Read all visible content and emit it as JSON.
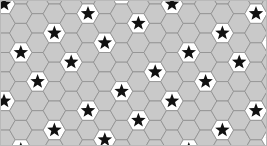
{
  "figure": {
    "kind": "tessellation-pattern",
    "width": 267,
    "height": 146,
    "background_color": "#ffffff"
  },
  "frame": {
    "visible": true,
    "color": "#b9b9b9",
    "width": 1
  },
  "hexagon": {
    "orientation": "flat-top",
    "circumradius": 11.2,
    "plain_fill": "#c9c9c9",
    "marked_fill": "#ffffff",
    "stroke": "#8e8e8e",
    "stroke_width": 0.8
  },
  "star": {
    "points": 5,
    "fill": "#111111",
    "stroke": "none",
    "outer_radius": 7.6,
    "inner_ratio": 0.42,
    "rotation_deg": 0
  },
  "grid": {
    "column_pitch": 16.8,
    "row_pitch": 19.4,
    "column_offset": 9.7,
    "origin_x": 4,
    "origin_y": 4,
    "columns": 17,
    "rows": 9,
    "marked_rule": "(col + 2*row) mod 5 == 0",
    "marked_modulus": 5,
    "marked_residue": 0,
    "marked_col_weight": 1,
    "marked_row_weight": 2
  },
  "legend": {
    "plain_cell_label": "plain hexagon",
    "marked_cell_label": "starred hexagon"
  }
}
